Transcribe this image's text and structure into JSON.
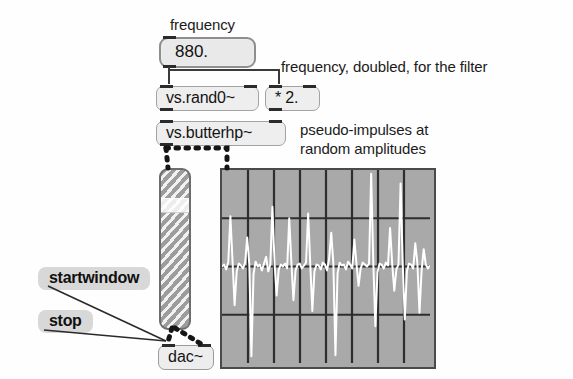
{
  "patch": {
    "title": "pseudo-impulse noise patch",
    "background_color": "#ffffff"
  },
  "comments": {
    "frequency_label": "frequency",
    "doubled_note": "frequency, doubled, for the filter",
    "impulses_note_line1": "pseudo-impulses at",
    "impulses_note_line2": "random amplitudes"
  },
  "number_box": {
    "name": "frequency-number-box",
    "value": "880."
  },
  "objects": {
    "rand0": "vs.rand0~",
    "times2": "* 2.",
    "butterhp": "vs.butterhp~",
    "dac": "dac~"
  },
  "messages": {
    "startwindow": "startwindow",
    "stop": "stop"
  },
  "slider": {
    "name": "output-level-slider",
    "value_fraction": 0.22,
    "orientation": "vertical"
  },
  "colors": {
    "box_fill": "#eeeeee",
    "box_border": "#a3a3a3",
    "message_fill": "#d8d8d8",
    "scope_background": "#a9a9a9",
    "scope_grid": "#2e2e2e",
    "waveform": "#ffffff",
    "wire": "#3a3a3a"
  },
  "chart_data": {
    "type": "line",
    "title": "pseudo-impulses at random amplitudes",
    "xlabel": "",
    "ylabel": "",
    "grid": true,
    "grid_columns": 8,
    "grid_rows": 4,
    "xlim": [
      0,
      100
    ],
    "ylim": [
      -1,
      1
    ],
    "legend": "none",
    "x": [
      0,
      1,
      2,
      3,
      4,
      5,
      6,
      7,
      8,
      9,
      10,
      11,
      12,
      13,
      14,
      15,
      16,
      17,
      18,
      19,
      20,
      21,
      22,
      23,
      24,
      25,
      26,
      27,
      28,
      29,
      30,
      31,
      32,
      33,
      34,
      35,
      36,
      37,
      38,
      39,
      40,
      41,
      42,
      43,
      44,
      45,
      46,
      47,
      48,
      49,
      50,
      51,
      52,
      53,
      54,
      55,
      56,
      57,
      58,
      59,
      60,
      61,
      62,
      63,
      64,
      65,
      66,
      67,
      68,
      69,
      70,
      71,
      72,
      73,
      74,
      75,
      76,
      77,
      78,
      79,
      80,
      81,
      82,
      83,
      84,
      85,
      86,
      87,
      88,
      89,
      90,
      91,
      92,
      93,
      94,
      95,
      96,
      97,
      98,
      99
    ],
    "values": [
      0.0,
      0.02,
      -0.03,
      0.05,
      0.52,
      0.06,
      -0.4,
      -0.05,
      0.03,
      0.01,
      -0.02,
      0.04,
      0.3,
      0.02,
      -0.93,
      -0.08,
      0.05,
      0.0,
      0.02,
      -0.04,
      0.03,
      0.1,
      -0.05,
      0.02,
      0.62,
      0.04,
      -0.3,
      -0.03,
      0.02,
      0.0,
      0.03,
      -0.02,
      0.5,
      0.05,
      -0.35,
      -0.04,
      0.02,
      0.03,
      -0.02,
      0.01,
      0.04,
      0.55,
      0.03,
      -0.46,
      -0.05,
      0.02,
      0.01,
      -0.03,
      0.04,
      0.02,
      -0.04,
      0.08,
      0.35,
      0.03,
      -0.92,
      -0.07,
      0.04,
      0.01,
      0.02,
      -0.03,
      0.05,
      0.02,
      -0.02,
      0.28,
      0.03,
      -0.2,
      -0.02,
      0.04,
      0.02,
      0.0,
      0.03,
      0.96,
      0.05,
      -0.62,
      -0.06,
      0.03,
      0.02,
      -0.02,
      0.04,
      0.01,
      0.4,
      0.03,
      -0.25,
      -0.03,
      0.02,
      0.86,
      0.04,
      -0.55,
      -0.05,
      0.03,
      0.02,
      -0.02,
      0.24,
      0.03,
      -0.48,
      -0.04,
      0.18,
      0.02,
      -0.02,
      0.01
    ]
  }
}
